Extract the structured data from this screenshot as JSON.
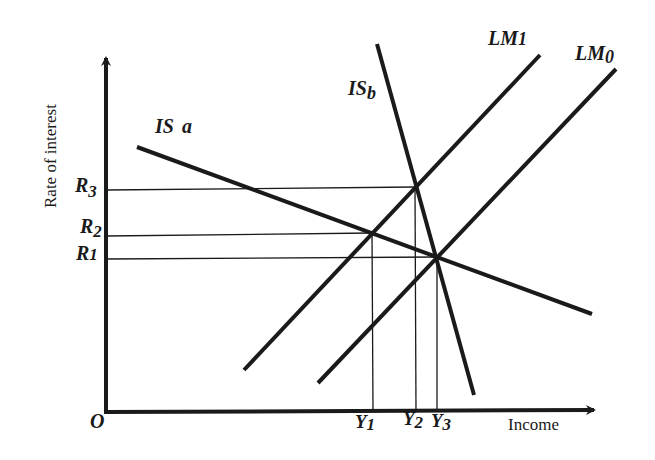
{
  "diagram": {
    "type": "IS-LM model",
    "y_axis_label": "Rate of interest",
    "x_axis_label": "Income",
    "origin_label": "O",
    "curves": [
      {
        "id": "IS_a",
        "label_main": "IS",
        "label_sub": "a",
        "kind": "IS",
        "slope": "downward, gentle"
      },
      {
        "id": "IS_b",
        "label_main": "IS",
        "label_sub": "b",
        "kind": "IS",
        "slope": "downward, steep"
      },
      {
        "id": "LM1",
        "label_main": "LM",
        "label_sub": "1",
        "kind": "LM",
        "slope": "upward"
      },
      {
        "id": "LM0",
        "label_main": "LM",
        "label_sub": "0",
        "kind": "LM",
        "slope": "upward"
      }
    ],
    "interest_levels": [
      {
        "main": "R",
        "sub": "3"
      },
      {
        "main": "R",
        "sub": "2"
      },
      {
        "main": "R",
        "sub": "1"
      }
    ],
    "income_levels": [
      {
        "main": "Y",
        "sub": "1"
      },
      {
        "main": "Y",
        "sub": "2"
      },
      {
        "main": "Y",
        "sub": "3"
      }
    ],
    "equilibria": [
      {
        "curves": [
          "IS_a",
          "LM1"
        ],
        "interest": "R2",
        "income": "Y1"
      },
      {
        "curves": [
          "IS_b",
          "LM1"
        ],
        "interest": "R3",
        "income": "Y2"
      },
      {
        "curves": [
          "IS_a",
          "IS_b",
          "LM0"
        ],
        "interest": "R1",
        "income": "Y3"
      }
    ],
    "colors": {
      "ink": "#1a1a1a",
      "background": "#ffffff"
    }
  }
}
